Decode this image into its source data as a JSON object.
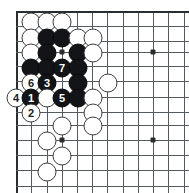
{
  "figure": {
    "type": "go-board-diagram",
    "title": "",
    "board_size": 19,
    "region": "upper-left corner",
    "background_color": "#ffffff",
    "line_color": "#555a5e",
    "edge_color": "#2a2d30",
    "black_color": "#121417",
    "white_color": "#ffffff"
  },
  "geometry": {
    "width": 189,
    "height": 193,
    "spacing": 15.2,
    "origin_x": 16,
    "origin_y": 11,
    "cols_px": [
      16,
      31,
      47,
      62,
      77,
      92,
      107,
      123,
      138,
      153,
      168,
      184
    ],
    "rows_px": [
      11,
      26,
      41,
      56,
      71,
      86,
      97,
      112,
      125,
      140,
      155,
      170,
      185
    ]
  },
  "lines": {
    "vertical_x": [
      16,
      31,
      47,
      62,
      77,
      92,
      107,
      123,
      138,
      153,
      168,
      184
    ],
    "horizontal_y": [
      11,
      26,
      41,
      52,
      66,
      81,
      97,
      112,
      125,
      140,
      155,
      170,
      186
    ],
    "left_edge_x": 16,
    "top_edge_y": 11
  },
  "star_points": [
    {
      "name": "hoshi-upper-left",
      "x": 62,
      "y": 52
    },
    {
      "name": "hoshi-upper-right",
      "x": 153,
      "y": 52
    },
    {
      "name": "hoshi-lower-left",
      "x": 62,
      "y": 140
    },
    {
      "name": "hoshi-lower-right",
      "x": 153,
      "y": 140
    }
  ],
  "stones": [
    {
      "id": "w-a1",
      "color": "white",
      "label": "",
      "x": 31,
      "y": 22
    },
    {
      "id": "w-a2",
      "color": "white",
      "label": "",
      "x": 47,
      "y": 22
    },
    {
      "id": "w-a3",
      "color": "white",
      "label": "",
      "x": 62,
      "y": 22
    },
    {
      "id": "w-b1",
      "color": "white",
      "label": "",
      "x": 31,
      "y": 38
    },
    {
      "id": "b-b2",
      "color": "black",
      "label": "",
      "x": 47,
      "y": 38
    },
    {
      "id": "b-b3",
      "color": "black",
      "label": "",
      "x": 62,
      "y": 38
    },
    {
      "id": "w-b4",
      "color": "white",
      "label": "",
      "x": 78,
      "y": 38
    },
    {
      "id": "w-b5",
      "color": "white",
      "label": "",
      "x": 93,
      "y": 38
    },
    {
      "id": "w-c1",
      "color": "white",
      "label": "",
      "x": 31,
      "y": 53
    },
    {
      "id": "b-c2",
      "color": "black",
      "label": "",
      "x": 47,
      "y": 53
    },
    {
      "id": "b-c4",
      "color": "black",
      "label": "",
      "x": 78,
      "y": 53
    },
    {
      "id": "w-c5",
      "color": "white",
      "label": "",
      "x": 93,
      "y": 53
    },
    {
      "id": "b-d1",
      "color": "black",
      "label": "",
      "x": 31,
      "y": 68
    },
    {
      "id": "b-d2",
      "color": "black",
      "label": "",
      "x": 47,
      "y": 68
    },
    {
      "id": "b-d3",
      "color": "black",
      "label": "7",
      "x": 62,
      "y": 68
    },
    {
      "id": "b-d4",
      "color": "black",
      "label": "",
      "x": 78,
      "y": 68
    },
    {
      "id": "w-e1",
      "color": "white",
      "label": "6",
      "x": 31,
      "y": 83
    },
    {
      "id": "b-e2",
      "color": "black",
      "label": "3",
      "x": 47,
      "y": 83
    },
    {
      "id": "b-e4",
      "color": "black",
      "label": "",
      "x": 78,
      "y": 83
    },
    {
      "id": "w-e5",
      "color": "white",
      "label": "",
      "x": 108,
      "y": 83
    },
    {
      "id": "w-f0",
      "color": "white",
      "label": "4",
      "x": 16,
      "y": 98
    },
    {
      "id": "b-f1",
      "color": "black",
      "label": "1",
      "x": 31,
      "y": 98
    },
    {
      "id": "w-f2",
      "color": "white",
      "label": "",
      "x": 47,
      "y": 98
    },
    {
      "id": "b-f3",
      "color": "black",
      "label": "5",
      "x": 62,
      "y": 98
    },
    {
      "id": "b-f4",
      "color": "black",
      "label": "",
      "x": 78,
      "y": 98
    },
    {
      "id": "w-f5",
      "color": "white",
      "label": "",
      "x": 93,
      "y": 98
    },
    {
      "id": "w-g1",
      "color": "white",
      "label": "2",
      "x": 31,
      "y": 113
    },
    {
      "id": "w-g5",
      "color": "white",
      "label": "",
      "x": 93,
      "y": 113
    },
    {
      "id": "w-h3",
      "color": "white",
      "label": "",
      "x": 62,
      "y": 126
    },
    {
      "id": "w-h5",
      "color": "white",
      "label": "",
      "x": 93,
      "y": 126
    },
    {
      "id": "w-i2",
      "color": "white",
      "label": "",
      "x": 47,
      "y": 141
    },
    {
      "id": "w-j3",
      "color": "white",
      "label": "",
      "x": 62,
      "y": 156
    },
    {
      "id": "w-k2",
      "color": "white",
      "label": "",
      "x": 47,
      "y": 172
    }
  ],
  "move_sequence": [
    {
      "number": 1,
      "color": "black",
      "x": 31,
      "y": 98
    },
    {
      "number": 2,
      "color": "white",
      "x": 31,
      "y": 113
    },
    {
      "number": 3,
      "color": "black",
      "x": 47,
      "y": 83
    },
    {
      "number": 4,
      "color": "white",
      "x": 16,
      "y": 98
    },
    {
      "number": 5,
      "color": "black",
      "x": 62,
      "y": 98
    },
    {
      "number": 6,
      "color": "white",
      "x": 31,
      "y": 83
    },
    {
      "number": 7,
      "color": "black",
      "x": 62,
      "y": 68
    }
  ]
}
